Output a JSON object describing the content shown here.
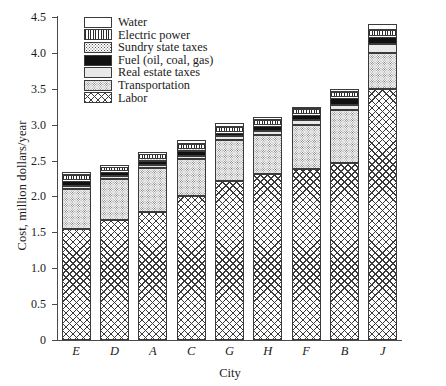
{
  "chart_data": {
    "type": "bar",
    "stacked": true,
    "title": "",
    "xlabel": "City",
    "ylabel": "Cost, million dollars/year",
    "categories": [
      "E",
      "D",
      "A",
      "C",
      "G",
      "H",
      "F",
      "B",
      "J"
    ],
    "ylim": [
      0,
      4.5
    ],
    "ytick_labels": [
      "0",
      "0.5",
      "1.0",
      "1.5",
      "2.0",
      "2.5",
      "3.0",
      "3.5",
      "4.0",
      "4.5"
    ],
    "ytick_values": [
      0,
      0.5,
      1.0,
      1.5,
      2.0,
      2.5,
      3.0,
      3.5,
      4.0,
      4.5
    ],
    "grid": false,
    "legend_position": "upper-left-inside",
    "series": [
      {
        "name": "Labor",
        "pattern": "labor",
        "values": [
          1.55,
          1.67,
          1.79,
          2.0,
          2.22,
          2.31,
          2.38,
          2.47,
          3.5
        ]
      },
      {
        "name": "Transportation",
        "pattern": "transport",
        "values": [
          0.55,
          0.58,
          0.6,
          0.52,
          0.56,
          0.55,
          0.62,
          0.74,
          0.5
        ]
      },
      {
        "name": "Real estate taxes",
        "pattern": "realestate",
        "values": [
          0.04,
          0.04,
          0.05,
          0.05,
          0.06,
          0.05,
          0.06,
          0.06,
          0.12
        ]
      },
      {
        "name": "Fuel (oil, coal, gas)",
        "pattern": "fuel",
        "values": [
          0.07,
          0.05,
          0.06,
          0.07,
          0.04,
          0.07,
          0.07,
          0.1,
          0.1
        ]
      },
      {
        "name": "Sundry state taxes",
        "pattern": "sundry",
        "values": [
          0.02,
          0.01,
          0.02,
          0.02,
          0.02,
          0.02,
          0.02,
          0.02,
          0.02
        ]
      },
      {
        "name": "Electric power",
        "pattern": "electric",
        "values": [
          0.07,
          0.06,
          0.07,
          0.07,
          0.07,
          0.07,
          0.07,
          0.07,
          0.08
        ]
      },
      {
        "name": "Water",
        "pattern": "water",
        "values": [
          0.04,
          0.01,
          0.03,
          0.06,
          0.05,
          0.03,
          0.03,
          0.04,
          0.08
        ]
      }
    ],
    "totals": [
      2.34,
      2.42,
      2.62,
      2.79,
      3.02,
      3.1,
      3.25,
      3.5,
      4.4
    ],
    "legend": [
      {
        "label": "Water",
        "pattern": "water"
      },
      {
        "label": "Electric power",
        "pattern": "electric"
      },
      {
        "label": "Sundry state taxes",
        "pattern": "sundry"
      },
      {
        "label": "Fuel (oil, coal, gas)",
        "pattern": "fuel"
      },
      {
        "label": "Real estate taxes",
        "pattern": "realestate"
      },
      {
        "label": "Transportation",
        "pattern": "transport"
      },
      {
        "label": "Labor",
        "pattern": "labor"
      }
    ]
  }
}
